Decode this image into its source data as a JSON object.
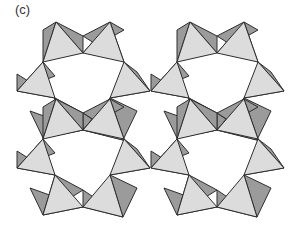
{
  "figure": {
    "label": "(c)",
    "colors": {
      "light_face": "#dcdcdc",
      "dark_face": "#9b9b9b",
      "edge": "#2e2e2e",
      "background": "#ffffff"
    },
    "ring_offsets": [
      [
        0,
        0
      ],
      [
        134,
        0
      ],
      [
        0,
        77
      ],
      [
        134,
        77
      ]
    ],
    "ring_tetrahedra": [
      {
        "b": [
          43,
          62
        ],
        "c": [
          83,
          53
        ],
        "apex": [
          56,
          22
        ],
        "flap_outer": [
          43,
          30
        ],
        "flap_inner": [
          83,
          36
        ]
      },
      {
        "b": [
          83,
          53
        ],
        "c": [
          124,
          62
        ],
        "apex": [
          110,
          22
        ],
        "flap_outer": [
          124,
          30
        ],
        "flap_inner": [
          83,
          36
        ]
      },
      {
        "b": [
          124,
          62
        ],
        "c": [
          110,
          98
        ],
        "apex": [
          150,
          91
        ],
        "flap_outer": [
          137,
          72
        ],
        "flap_inner": [
          124,
          80
        ]
      },
      {
        "b": [
          110,
          98
        ],
        "c": [
          83,
          130
        ],
        "apex": [
          123,
          140
        ],
        "flap_outer": [
          137,
          111
        ],
        "flap_inner": [
          83,
          113
        ]
      },
      {
        "b": [
          83,
          130
        ],
        "c": [
          55,
          98
        ],
        "apex": [
          43,
          138
        ],
        "flap_outer": [
          30,
          111
        ],
        "flap_inner": [
          83,
          113
        ]
      },
      {
        "b": [
          55,
          98
        ],
        "c": [
          43,
          62
        ],
        "apex": [
          17,
          91
        ],
        "flap_outer": [
          17,
          74
        ],
        "flap_inner": [
          55,
          76
        ]
      }
    ]
  }
}
